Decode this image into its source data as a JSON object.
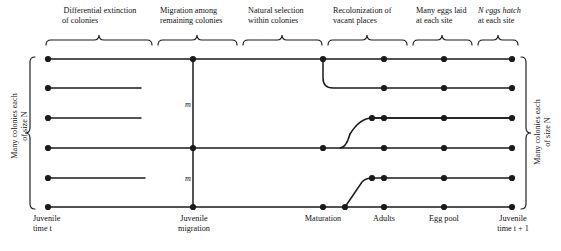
{
  "figure": {
    "type": "life-cycle-flow-diagram",
    "stroke_color": "#1a1a1a",
    "background_color": "#ffffff",
    "phases": [
      {
        "id": "differential-extinction",
        "label_line1": "Differential extinction",
        "label_line2": "of colonies",
        "brace_x_start": 46,
        "brace_x_end": 152,
        "center_x": 99
      },
      {
        "id": "migration-among-remaining",
        "label_line1": "Migration among",
        "label_line2": "remaining colonies",
        "brace_x_start": 158,
        "brace_x_end": 237,
        "center_x": 197
      },
      {
        "id": "natural-selection-within",
        "label_line1": "Natural selection",
        "label_line2": "within colonies",
        "brace_x_start": 243,
        "brace_x_end": 322,
        "center_x": 282
      },
      {
        "id": "recolonization-vacant",
        "label_line1": "Recolonization of",
        "label_line2": "vacant places",
        "brace_x_start": 328,
        "brace_x_end": 407,
        "center_x": 367
      },
      {
        "id": "many-eggs-laid",
        "label_line1": "Many eggs laid",
        "label_line2": "at each site",
        "brace_x_start": 413,
        "brace_x_end": 472,
        "center_x": 442
      },
      {
        "id": "n-eggs-hatch",
        "label_line1": "N eggs hatch",
        "label_line2": "at each site",
        "brace_x_start": 478,
        "brace_x_end": 518,
        "center_x": 498
      }
    ],
    "stages": [
      {
        "id": "juvenile-time-t",
        "label_line1": "Juvenile",
        "label_line2": "time t",
        "x": 48
      },
      {
        "id": "juvenile-migration",
        "label_line1": "Juvenile",
        "label_line2": "migration",
        "x": 193
      },
      {
        "id": "maturation",
        "label_line1": "Maturation",
        "label_line2": "",
        "x": 323
      },
      {
        "id": "adults",
        "label_line1": "Adults",
        "label_line2": "",
        "x": 384
      },
      {
        "id": "egg-pool",
        "label_line1": "Egg pool",
        "label_line2": "",
        "x": 444
      },
      {
        "id": "juvenile-time-t-plus-1",
        "label_line1": "Juvenile",
        "label_line2": "time t + 1",
        "x": 512
      }
    ],
    "migration_labels": [
      {
        "id": "m-upper",
        "text": "m",
        "x": 188,
        "y": 104
      },
      {
        "id": "m-lower",
        "text": "m",
        "x": 188,
        "y": 178
      }
    ],
    "side_labels": {
      "left": {
        "line1": "Many colonies each",
        "line2": "of size N",
        "brace_top": 57,
        "brace_bottom": 209
      },
      "right": {
        "line1": "Many colonies each",
        "line2": "of size N",
        "brace_top": 57,
        "brace_bottom": 209
      }
    },
    "rows_y": [
      59,
      88,
      118,
      148,
      178,
      207
    ],
    "nodes": [
      {
        "row": 0,
        "x": 48
      },
      {
        "row": 0,
        "x": 193
      },
      {
        "row": 0,
        "x": 323
      },
      {
        "row": 0,
        "x": 384
      },
      {
        "row": 0,
        "x": 444
      },
      {
        "row": 0,
        "x": 512
      },
      {
        "row": 1,
        "x": 48
      },
      {
        "row": 1,
        "x": 384
      },
      {
        "row": 1,
        "x": 444
      },
      {
        "row": 1,
        "x": 512
      },
      {
        "row": 2,
        "x": 48
      },
      {
        "row": 2,
        "x": 384
      },
      {
        "row": 2,
        "x": 444
      },
      {
        "row": 2,
        "x": 512
      },
      {
        "row": 3,
        "x": 48
      },
      {
        "row": 3,
        "x": 193
      },
      {
        "row": 3,
        "x": 323
      },
      {
        "row": 3,
        "x": 384
      },
      {
        "row": 3,
        "x": 444
      },
      {
        "row": 3,
        "x": 512
      },
      {
        "row": 4,
        "x": 48
      },
      {
        "row": 4,
        "x": 384
      },
      {
        "row": 4,
        "x": 444
      },
      {
        "row": 4,
        "x": 512
      },
      {
        "row": 5,
        "x": 48
      },
      {
        "row": 5,
        "x": 193
      },
      {
        "row": 5,
        "x": 323
      },
      {
        "row": 5,
        "x": 345
      },
      {
        "row": 5,
        "x": 384
      },
      {
        "row": 5,
        "x": 444
      },
      {
        "row": 5,
        "x": 512
      }
    ],
    "extinct_line_ends": [
      {
        "row": 1,
        "x_start": 48,
        "x_end": 141
      },
      {
        "row": 2,
        "x_start": 48,
        "x_end": 141
      },
      {
        "row": 4,
        "x_start": 48,
        "x_end": 145
      }
    ]
  }
}
